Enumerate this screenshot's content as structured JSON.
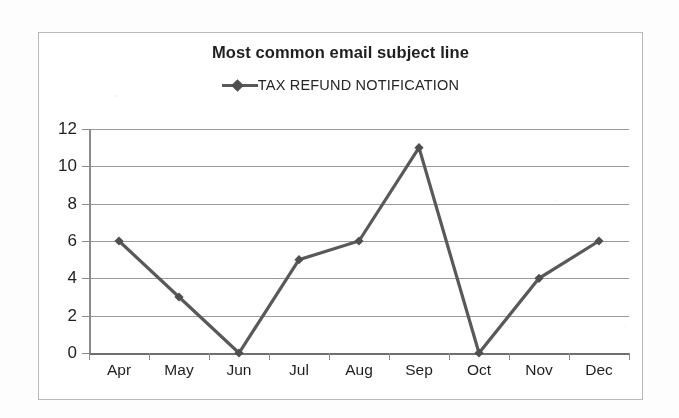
{
  "chart_data": {
    "type": "line",
    "title": "Most common email subject line",
    "xlabel": "",
    "ylabel": "",
    "categories": [
      "Apr",
      "May",
      "Jun",
      "Jul",
      "Aug",
      "Sep",
      "Oct",
      "Nov",
      "Dec"
    ],
    "series": [
      {
        "name": "TAX REFUND NOTIFICATION",
        "values": [
          6,
          3,
          0,
          5,
          6,
          11,
          0,
          4,
          6
        ]
      }
    ],
    "ylim": [
      0,
      12
    ],
    "ytick_step": 2,
    "yticks": [
      12,
      10,
      8,
      6,
      4,
      2,
      0
    ],
    "ytick_labels": [
      "12",
      "10",
      "8",
      "6",
      "4",
      "2",
      "0"
    ],
    "grid": true,
    "grid_axis": "y",
    "legend_position": "top-center",
    "marker": "diamond",
    "line_color": "#595959",
    "marker_color": "#4f4f4f",
    "grid_color": "#9a9a9a",
    "axis_color": "#8b8b8b",
    "title_color": "#1f1f1f",
    "plot_background": "#ffffff",
    "frame_color": "#b9b9b9"
  },
  "legend": {
    "entries": [
      {
        "label": "TAX REFUND NOTIFICATION",
        "marker": "diamond-line-marker"
      }
    ]
  }
}
